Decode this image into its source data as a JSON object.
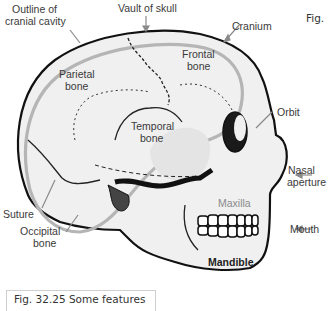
{
  "figure": {
    "corner_tag": "Fig.",
    "caption": "Fig. 32.25 Some features"
  },
  "labels": {
    "outline_cranial_cavity_1": "Outline of",
    "outline_cranial_cavity_2": "cranial cavity",
    "vault_of_skull": "Vault of skull",
    "cranium": "Cranium",
    "frontal_1": "Frontal",
    "frontal_2": "bone",
    "parietal_1": "Parietal",
    "parietal_2": "bone",
    "temporal_1": "Temporal",
    "temporal_2": "bone",
    "orbit": "Orbit",
    "nasal_1": "Nasal",
    "nasal_2": "aperture",
    "maxilla": "Maxilla",
    "mouth": "Mouth",
    "mandible": "Mandible",
    "suture": "Suture",
    "occipital_1": "Occipital",
    "occipital_2": "bone"
  },
  "colors": {
    "outline": "#111111",
    "cavity_line": "#b5b5b5",
    "bone_fill": "#ececec",
    "label_text": "#3a3a3a",
    "arrow": "#8a8a8a"
  }
}
